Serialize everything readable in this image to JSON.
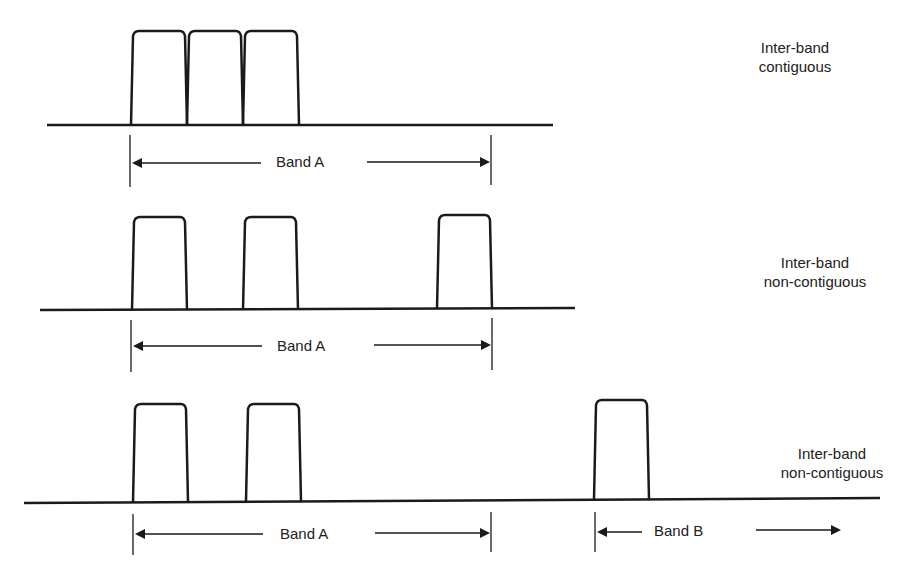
{
  "diagram": {
    "type": "carrier-aggregation-spectrum",
    "rows": [
      {
        "id": "row1",
        "title_line1": "Inter-band",
        "title_line2": "contiguous",
        "band_labels": [
          "Band A"
        ],
        "carriers": 3
      },
      {
        "id": "row2",
        "title_line1": "Inter-band",
        "title_line2": "non-contiguous",
        "band_labels": [
          "Band A"
        ],
        "carriers": 3
      },
      {
        "id": "row3",
        "title_line1": "Inter-band",
        "title_line2": "non-contiguous",
        "band_labels": [
          "Band A",
          "Band B"
        ],
        "carriers": 3
      }
    ],
    "colors": {
      "line": "#1a1a1a",
      "text": "#222222",
      "background": "#ffffff"
    }
  }
}
